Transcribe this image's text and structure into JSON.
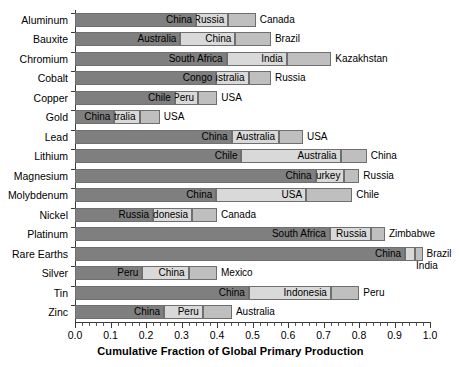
{
  "chart_data": {
    "type": "bar",
    "orientation": "horizontal",
    "stacked": true,
    "title": "",
    "xlabel": "Cumulative Fraction of Global Primary Production",
    "ylabel": "",
    "xlim": [
      0.0,
      1.0
    ],
    "grid": false,
    "legend": "none",
    "xticks": [
      "0.0",
      "0.1",
      "0.2",
      "0.3",
      "0.4",
      "0.5",
      "0.6",
      "0.7",
      "0.8",
      "0.9",
      "1.0"
    ],
    "xtick_values": [
      0.0,
      0.1,
      0.2,
      0.3,
      0.4,
      0.5,
      0.6,
      0.7,
      0.8,
      0.9,
      1.0
    ],
    "categories": [
      "Aluminum",
      "Bauxite",
      "Chromium",
      "Cobalt",
      "Copper",
      "Gold",
      "Lead",
      "Lithium",
      "Magnesium",
      "Molybdenum",
      "Nickel",
      "Platinum",
      "Rare Earths",
      "Silver",
      "Tin",
      "Zinc"
    ],
    "colors": {
      "segment_1": "#7f7f7f",
      "segment_2": "#d9d9d9",
      "segment_3": "#bfbfbf",
      "edge": "#6f6f6f",
      "axis": "#3a3a3a",
      "text": "#000000",
      "background": "#ffffff"
    },
    "rows": [
      {
        "category": "Aluminum",
        "segments": [
          {
            "label": "China",
            "cumulative": 0.341,
            "label_position": "inside"
          },
          {
            "label": "Russia",
            "cumulative": 0.432,
            "label_position": "inside"
          },
          {
            "label": "Canada",
            "cumulative": 0.509,
            "label_position": "outside"
          }
        ]
      },
      {
        "category": "Bauxite",
        "segments": [
          {
            "label": "Australia",
            "cumulative": 0.297,
            "label_position": "inside"
          },
          {
            "label": "China",
            "cumulative": 0.452,
            "label_position": "inside"
          },
          {
            "label": "Brazil",
            "cumulative": 0.552,
            "label_position": "outside"
          }
        ]
      },
      {
        "category": "Chromium",
        "segments": [
          {
            "label": "South Africa",
            "cumulative": 0.427,
            "label_position": "inside"
          },
          {
            "label": "India",
            "cumulative": 0.597,
            "label_position": "inside"
          },
          {
            "label": "Kazakhstan",
            "cumulative": 0.722,
            "label_position": "outside"
          }
        ]
      },
      {
        "category": "Cobalt",
        "segments": [
          {
            "label": "Congo",
            "cumulative": 0.398,
            "label_position": "inside"
          },
          {
            "label": "Australia",
            "cumulative": 0.489,
            "label_position": "inside"
          },
          {
            "label": "Russia",
            "cumulative": 0.552,
            "label_position": "outside"
          }
        ]
      },
      {
        "category": "Copper",
        "segments": [
          {
            "label": "Chile",
            "cumulative": 0.281,
            "label_position": "inside"
          },
          {
            "label": "Peru",
            "cumulative": 0.347,
            "label_position": "inside"
          },
          {
            "label": "USA",
            "cumulative": 0.401,
            "label_position": "outside"
          }
        ]
      },
      {
        "category": "Gold",
        "segments": [
          {
            "label": "China",
            "cumulative": 0.111,
            "label_position": "inside"
          },
          {
            "label": "Australia",
            "cumulative": 0.182,
            "label_position": "inside"
          },
          {
            "label": "USA",
            "cumulative": 0.239,
            "label_position": "outside"
          }
        ]
      },
      {
        "category": "Lead",
        "segments": [
          {
            "label": "China",
            "cumulative": 0.441,
            "label_position": "inside"
          },
          {
            "label": "Australia",
            "cumulative": 0.575,
            "label_position": "inside"
          },
          {
            "label": "USA",
            "cumulative": 0.642,
            "label_position": "outside"
          }
        ]
      },
      {
        "category": "Lithium",
        "segments": [
          {
            "label": "Chile",
            "cumulative": 0.469,
            "label_position": "inside"
          },
          {
            "label": "Australia",
            "cumulative": 0.748,
            "label_position": "inside"
          },
          {
            "label": "China",
            "cumulative": 0.822,
            "label_position": "outside"
          }
        ]
      },
      {
        "category": "Magnesium",
        "segments": [
          {
            "label": "China",
            "cumulative": 0.678,
            "label_position": "inside"
          },
          {
            "label": "Turkey",
            "cumulative": 0.759,
            "label_position": "inside"
          },
          {
            "label": "Russia",
            "cumulative": 0.801,
            "label_position": "outside"
          }
        ]
      },
      {
        "category": "Molybdenum",
        "segments": [
          {
            "label": "China",
            "cumulative": 0.398,
            "label_position": "inside"
          },
          {
            "label": "USA",
            "cumulative": 0.651,
            "label_position": "inside"
          },
          {
            "label": "Chile",
            "cumulative": 0.781,
            "label_position": "outside"
          }
        ]
      },
      {
        "category": "Nickel",
        "segments": [
          {
            "label": "Russia",
            "cumulative": 0.22,
            "label_position": "inside"
          },
          {
            "label": "Indonesia",
            "cumulative": 0.33,
            "label_position": "inside"
          },
          {
            "label": "Canada",
            "cumulative": 0.4,
            "label_position": "outside"
          }
        ]
      },
      {
        "category": "Platinum",
        "segments": [
          {
            "label": "South Africa",
            "cumulative": 0.718,
            "label_position": "inside"
          },
          {
            "label": "Russia",
            "cumulative": 0.833,
            "label_position": "inside"
          },
          {
            "label": "Zimbabwe",
            "cumulative": 0.873,
            "label_position": "outside"
          }
        ]
      },
      {
        "category": "Rare Earths",
        "segments": [
          {
            "label": "China",
            "cumulative": 0.93,
            "label_position": "inside"
          },
          {
            "label": "India",
            "cumulative": 0.958,
            "label_position": "below"
          },
          {
            "label": "Brazil",
            "cumulative": 0.979,
            "label_position": "outside"
          }
        ]
      },
      {
        "category": "Silver",
        "segments": [
          {
            "label": "Peru",
            "cumulative": 0.19,
            "label_position": "inside"
          },
          {
            "label": "China",
            "cumulative": 0.32,
            "label_position": "inside"
          },
          {
            "label": "Mexico",
            "cumulative": 0.4,
            "label_position": "outside"
          }
        ]
      },
      {
        "category": "Tin",
        "segments": [
          {
            "label": "China",
            "cumulative": 0.49,
            "label_position": "inside"
          },
          {
            "label": "Indonesia",
            "cumulative": 0.721,
            "label_position": "inside"
          },
          {
            "label": "Peru",
            "cumulative": 0.801,
            "label_position": "outside"
          }
        ]
      },
      {
        "category": "Zinc",
        "segments": [
          {
            "label": "China",
            "cumulative": 0.251,
            "label_position": "inside"
          },
          {
            "label": "Peru",
            "cumulative": 0.36,
            "label_position": "inside"
          },
          {
            "label": "Australia",
            "cumulative": 0.442,
            "label_position": "outside"
          }
        ]
      }
    ]
  }
}
